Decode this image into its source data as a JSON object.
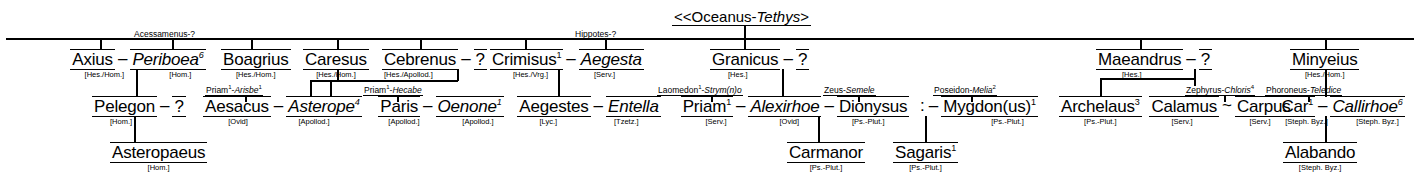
{
  "chart": {
    "root": {
      "prefix": "<<",
      "name_a": "Oceanus",
      "sep": "-",
      "name_b": "Tethys",
      "suffix": ">"
    },
    "generation1": [
      {
        "id": "axius",
        "name": "Axius",
        "source": "[Hes./Hom.]",
        "spouse": "Periboea",
        "spouse_sup": "6",
        "spouse_source": "[Hom.]",
        "spouse_parents": "Acessamenus-?"
      },
      {
        "id": "boagrius",
        "name": "Boagrius",
        "source": "[Hes./Hom.]"
      },
      {
        "id": "caresus",
        "name": "Caresus",
        "source": "[Hes./Hom.]"
      },
      {
        "id": "cebrenus",
        "name": "Cebrenus",
        "source": "[Hes./Apollod.]",
        "spouse": "?"
      },
      {
        "id": "crimisus",
        "name": "Crimisus",
        "name_sup": "1",
        "source": "[Hes./Vrg.]",
        "spouse": "Aegesta",
        "spouse_source": "[Serv.]",
        "spouse_parents": "Hippotes-?",
        "spouse_parents_sup": "2"
      },
      {
        "id": "granicus",
        "name": "Granicus",
        "source": "[Hes.]",
        "spouse": "?"
      },
      {
        "id": "maeandrus",
        "name": "Maeandrus",
        "source": "[Hes.]",
        "spouse": "?"
      },
      {
        "id": "minyeius",
        "name": "Minyeius",
        "source": "[Hes./Hom.]"
      }
    ],
    "generation2": [
      {
        "id": "pelegon",
        "name": "Pelegon",
        "source": "[Hom.]",
        "spouse": "?"
      },
      {
        "id": "aesacus",
        "name": "Aesacus",
        "source": "[Ovid]",
        "parents": "Priam-Arisbe",
        "parents_sup1": "1",
        "parents_sup2": "1",
        "spouse": "Asterope",
        "spouse_sup": "4",
        "spouse_source": "[Apollod.]"
      },
      {
        "id": "paris",
        "name": "Paris",
        "source": "[Apollod.]",
        "parents": "Priam-Hecabe",
        "parents_sup1": "1",
        "spouse": "Oenone",
        "spouse_sup": "1",
        "spouse_source": "[Apollod.]"
      },
      {
        "id": "aegestes",
        "name": "Aegestes",
        "source": "[Lyc.]",
        "spouse": "Entella",
        "spouse_source": "[Tzetz.]"
      },
      {
        "id": "priam",
        "name": "Priam",
        "name_sup": "1",
        "source": "[Serv.]",
        "parents": "Laomedon-Strym(n)o",
        "parents_sup1": "1",
        "spouse": "Alexirhoe",
        "spouse_source": "[Ovid]"
      },
      {
        "id": "dionysus",
        "name": "Dionysus",
        "source": "[Ps.-Plut.]",
        "parents": "Zeus-Semele"
      },
      {
        "id": "mygdon",
        "name": "Mygdon(us)",
        "name_sup": "1",
        "source": "[Ps.-Plut.]",
        "parents": "Poseidon-Melia",
        "parents_sup": "2",
        "prefix": ":"
      },
      {
        "id": "archelaus",
        "name": "Archelaus",
        "name_sup": "3",
        "source": "[Ps.-Plut.]"
      },
      {
        "id": "calamus",
        "name": "Calamus",
        "source": "[Serv.]",
        "spouse": "Carpus",
        "spouse_source": "[Serv.]",
        "join": "~"
      },
      {
        "id": "car",
        "name": "Car",
        "name_sup": "1",
        "source": "[Steph. Byz.]",
        "parents": "Zephyrus-Chloris",
        "parents_sup": "4",
        "spouse": "Callirhoe",
        "spouse_sup": "6",
        "spouse_source": "[Steph. Byz.]",
        "spouse_parents": "Phoroneus-Teledice"
      }
    ],
    "generation3": [
      {
        "id": "asteropaeus",
        "name": "Asteropaeus",
        "source": "[Hom.]"
      },
      {
        "id": "carmanor",
        "name": "Carmanor",
        "source": "[Ps.-Plut.]"
      },
      {
        "id": "sagaris",
        "name": "Sagaris",
        "name_sup": "1",
        "source": "[Ps.-Plut.]"
      },
      {
        "id": "alabando",
        "name": "Alabando",
        "source": "[Steph. Byz.]"
      }
    ],
    "symbols": {
      "union_dash": "–",
      "union_tilde": "~",
      "unknown": "?"
    }
  }
}
